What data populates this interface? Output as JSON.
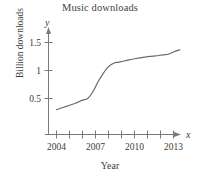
{
  "chart_data": {
    "type": "line",
    "title": "Music downloads",
    "xlabel": "Year",
    "ylabel": "Billion downloads",
    "x_axis_name": "x",
    "y_axis_name": "y",
    "grid": false,
    "legend": "none",
    "xlim": [
      2003.5,
      2014.0
    ],
    "ylim": [
      0,
      1.75
    ],
    "xticks": [
      2004,
      2005,
      2006,
      2007,
      2008,
      2009,
      2010,
      2011,
      2012,
      2013
    ],
    "xtick_labels": [
      "2004",
      "",
      "",
      "2007",
      "",
      "",
      "2010",
      "",
      "",
      "2013"
    ],
    "yticks": [
      0.5,
      1,
      1.5
    ],
    "ytick_labels": [
      "0.5",
      "1",
      "1.5"
    ],
    "series": [
      {
        "name": "Music downloads",
        "x": [
          2004,
          2004.5,
          2005,
          2005.5,
          2006,
          2006.4,
          2006.8,
          2007.2,
          2007.6,
          2008,
          2008.4,
          2008.8,
          2009.4,
          2010,
          2010.8,
          2011.6,
          2012.2,
          2012.6,
          2013,
          2013.5
        ],
        "values": [
          0.3,
          0.34,
          0.38,
          0.42,
          0.47,
          0.5,
          0.62,
          0.8,
          0.95,
          1.07,
          1.13,
          1.15,
          1.18,
          1.21,
          1.24,
          1.26,
          1.28,
          1.29,
          1.33,
          1.37
        ]
      }
    ],
    "line_color": "#6b6b6b",
    "axis_color": "#7a7a7a"
  }
}
